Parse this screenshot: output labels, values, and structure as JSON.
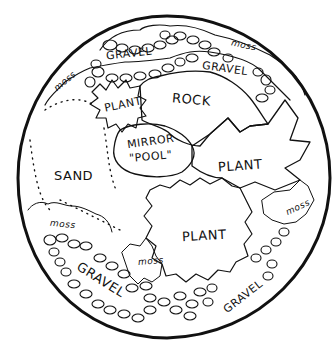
{
  "diagram": {
    "title": "",
    "colors": {
      "ink": "#111111",
      "background": "#ffffff"
    },
    "labels": [
      {
        "id": "gravel-top-left",
        "text": "GRAVEL",
        "x": 106,
        "y": 55,
        "rot": -6,
        "size": "mid"
      },
      {
        "id": "gravel-top-right",
        "text": "GRAVEL",
        "x": 202,
        "y": 68,
        "rot": 8,
        "size": "mid"
      },
      {
        "id": "moss-top-right",
        "text": "moss",
        "x": 231,
        "y": 45,
        "rot": 12,
        "size": "small"
      },
      {
        "id": "moss-top-left",
        "text": "moss",
        "x": 57,
        "y": 81,
        "rot": -40,
        "size": "small"
      },
      {
        "id": "plant-top",
        "text": "PLANT",
        "x": 104,
        "y": 103,
        "rot": -12,
        "size": "mid"
      },
      {
        "id": "rock",
        "text": "ROCK",
        "x": 172,
        "y": 96,
        "rot": 5,
        "size": "big"
      },
      {
        "id": "mirror",
        "text": "MIRROR",
        "x": 127,
        "y": 140,
        "rot": -8,
        "size": "mid"
      },
      {
        "id": "pool",
        "text": "\"POOL\"",
        "x": 129,
        "y": 154,
        "rot": -5,
        "size": "mid"
      },
      {
        "id": "plant-right",
        "text": "PLANT",
        "x": 218,
        "y": 163,
        "rot": -4,
        "size": "big"
      },
      {
        "id": "sand",
        "text": "SAND",
        "x": 54,
        "y": 166,
        "rot": 0,
        "size": "big"
      },
      {
        "id": "moss-right",
        "text": "moss",
        "x": 285,
        "y": 204,
        "rot": -25,
        "size": "small"
      },
      {
        "id": "moss-left",
        "text": "moss",
        "x": 50,
        "y": 221,
        "rot": 5,
        "size": "small"
      },
      {
        "id": "plant-bottom",
        "text": "PLANT",
        "x": 182,
        "y": 230,
        "rot": -3,
        "size": "big"
      },
      {
        "id": "moss-bottom",
        "text": "moss",
        "x": 138,
        "y": 257,
        "rot": -5,
        "size": "small"
      },
      {
        "id": "gravel-bottom-left",
        "text": "GRAVEL",
        "x": 72,
        "y": 275,
        "rot": 32,
        "size": "big"
      },
      {
        "id": "gravel-bottom-right",
        "text": "GRAVEL",
        "x": 222,
        "y": 292,
        "rot": -38,
        "size": "mid"
      }
    ]
  }
}
